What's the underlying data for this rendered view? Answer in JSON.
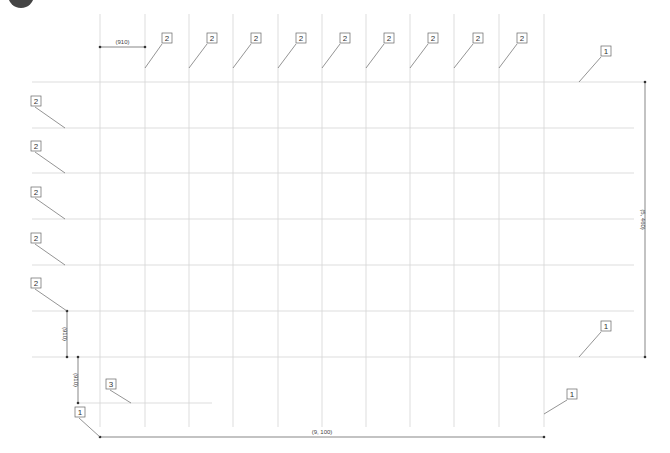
{
  "diagram": {
    "type": "grid-layout-plan",
    "corner_marker": "step-number-circle",
    "grid": {
      "vertical_x": [
        100,
        145,
        189,
        233,
        278,
        322,
        366,
        410,
        454,
        499,
        544
      ],
      "vertical_y_range": [
        14,
        427
      ],
      "horizontal_y": [
        82,
        128,
        173,
        219,
        265,
        311,
        357
      ],
      "horizontal_x_range": [
        32,
        634
      ],
      "outer_extension_x": 645,
      "line_color": "#d4d4d4"
    },
    "dimensions": {
      "top_spacing": {
        "label": "(910)",
        "x1": 100,
        "x2": 145,
        "y": 47
      },
      "left_upper": {
        "label": "(910)",
        "x": 67,
        "y1": 311,
        "y2": 357
      },
      "left_lower": {
        "label": "(910)",
        "x": 78,
        "y1": 357,
        "y2": 403
      },
      "total_height": {
        "label": "(5, 460)",
        "x": 645,
        "y1": 82,
        "y2": 357
      },
      "total_width": {
        "label": "(9, 100)",
        "x1": 100,
        "x2": 544,
        "y": 437
      }
    },
    "callouts": [
      {
        "label": "2",
        "box_x": 162,
        "box_y": 33,
        "to_x": 145,
        "to_y": 68
      },
      {
        "label": "2",
        "box_x": 207,
        "box_y": 33,
        "to_x": 189,
        "to_y": 68
      },
      {
        "label": "2",
        "box_x": 251,
        "box_y": 33,
        "to_x": 233,
        "to_y": 68
      },
      {
        "label": "2",
        "box_x": 296,
        "box_y": 33,
        "to_x": 278,
        "to_y": 68
      },
      {
        "label": "2",
        "box_x": 340,
        "box_y": 33,
        "to_x": 322,
        "to_y": 68
      },
      {
        "label": "2",
        "box_x": 384,
        "box_y": 33,
        "to_x": 366,
        "to_y": 68
      },
      {
        "label": "2",
        "box_x": 428,
        "box_y": 33,
        "to_x": 410,
        "to_y": 68
      },
      {
        "label": "2",
        "box_x": 473,
        "box_y": 33,
        "to_x": 454,
        "to_y": 68
      },
      {
        "label": "2",
        "box_x": 517,
        "box_y": 33,
        "to_x": 499,
        "to_y": 68
      },
      {
        "label": "1",
        "box_x": 601,
        "box_y": 46,
        "to_x": 579,
        "to_y": 82
      },
      {
        "label": "2",
        "box_x": 31,
        "box_y": 96,
        "to_x": 65,
        "to_y": 128
      },
      {
        "label": "2",
        "box_x": 31,
        "box_y": 141,
        "to_x": 65,
        "to_y": 173
      },
      {
        "label": "2",
        "box_x": 31,
        "box_y": 187,
        "to_x": 65,
        "to_y": 219
      },
      {
        "label": "2",
        "box_x": 31,
        "box_y": 233,
        "to_x": 65,
        "to_y": 265
      },
      {
        "label": "2",
        "box_x": 31,
        "box_y": 278,
        "to_x": 67,
        "to_y": 311
      },
      {
        "label": "1",
        "box_x": 601,
        "box_y": 321,
        "to_x": 579,
        "to_y": 357
      },
      {
        "label": "3",
        "box_x": 106,
        "box_y": 379,
        "to_x": 131,
        "to_y": 403
      },
      {
        "label": "1",
        "box_x": 75,
        "box_y": 407,
        "to_x": 100,
        "to_y": 437
      },
      {
        "label": "1",
        "box_x": 567,
        "box_y": 389,
        "to_x": 544,
        "to_y": 414
      }
    ],
    "short_line": {
      "x1": 78,
      "x2": 212,
      "y": 403
    }
  }
}
